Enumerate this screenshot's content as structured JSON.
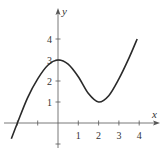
{
  "chart_data": {
    "type": "line",
    "title": "",
    "xlabel": "x",
    "ylabel": "y",
    "xlim": [
      -2.3,
      4.2
    ],
    "ylim": [
      -1.0,
      5.2
    ],
    "grid": false,
    "x_ticks": [
      -2,
      -1,
      1,
      2,
      3,
      4
    ],
    "x_tick_labels": [
      "",
      "",
      "1",
      "2",
      "3",
      "4"
    ],
    "y_ticks": [
      -1,
      1,
      2,
      3,
      4
    ],
    "y_tick_labels": [
      "",
      "1",
      "2",
      "3",
      "4"
    ],
    "series": [
      {
        "name": "f(x)",
        "x": [
          -2.3,
          -2.0,
          -1.5,
          -1.0,
          -0.5,
          0.0,
          0.5,
          1.0,
          1.5,
          2.0,
          2.5,
          3.0,
          3.5,
          3.9
        ],
        "y": [
          -0.75,
          0.0,
          1.2,
          2.1,
          2.75,
          3.0,
          2.8,
          2.2,
          1.4,
          1.0,
          1.3,
          2.1,
          3.1,
          4.0
        ]
      }
    ],
    "annotations": [
      "local maximum at (0, 3)",
      "local minimum at (2, 1)"
    ]
  },
  "style": {
    "curve_color": "#2a2a2a",
    "axis_color": "#555555",
    "text_color": "#333333"
  }
}
